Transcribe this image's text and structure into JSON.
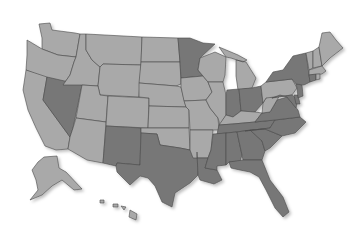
{
  "map": {
    "type": "choropleth",
    "region": "United States",
    "colors": {
      "light": "#a9a9a9",
      "dark": "#777777",
      "border": "#4a4a4a",
      "background": "#ffffff"
    },
    "dark_states": [
      "NV",
      "MN",
      "NM",
      "TX",
      "IN",
      "OH",
      "NY",
      "TN",
      "VA",
      "NC",
      "SC",
      "GA",
      "AL",
      "MS",
      "LA",
      "FL",
      "NJ",
      "MD",
      "DE",
      "CT"
    ],
    "light_states": [
      "WA",
      "OR",
      "CA",
      "ID",
      "MT",
      "WY",
      "UT",
      "AZ",
      "CO",
      "ND",
      "SD",
      "NE",
      "KS",
      "OK",
      "IA",
      "MO",
      "AR",
      "WI",
      "IL",
      "MI",
      "KY",
      "WV",
      "PA",
      "ME",
      "NH",
      "VT",
      "MA",
      "RI",
      "AK",
      "HI"
    ]
  }
}
